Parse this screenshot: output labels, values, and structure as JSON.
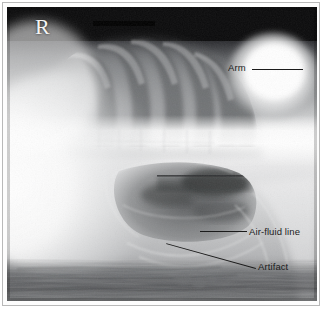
{
  "figure": {
    "type": "radiograph",
    "modality": "X-ray",
    "view": "lateral decubitus chest and abdomen",
    "laterality_marker": "R",
    "frame_color": "#b9b9b9",
    "mat_color": "#fdfdfd",
    "annotation_color": "#1b1b1b"
  },
  "annotations": [
    {
      "id": "arm",
      "label": "Arm",
      "label_x": 228,
      "label_y": 62,
      "leader": {
        "x1": 252,
        "y1": 69,
        "x2": 303,
        "y2": 69,
        "style": "horizontal"
      },
      "points_to": "bright rounded opacity at upper right of the film"
    },
    {
      "id": "air-fluid-line",
      "label": "Air-fluid line",
      "label_x": 249,
      "label_y": 226,
      "leader": {
        "x1": 200,
        "y1": 231,
        "x2": 247,
        "y2": 231,
        "style": "horizontal"
      },
      "points_to": "horizontal gas-fluid interface within the bowel loops"
    },
    {
      "id": "artifact",
      "label": "Artifact",
      "label_x": 258,
      "label_y": 261,
      "leader": {
        "x1": 256,
        "y1": 268,
        "x2": 166,
        "y2": 293,
        "style": "diagonal"
      },
      "points_to": "streaky overlying density at the lower edge of the film"
    }
  ],
  "anatomy_regions": [
    {
      "name": "ribs",
      "description": "obliquely oriented rib shadows with dark intercostal spaces over the thorax"
    },
    {
      "name": "lung-field",
      "description": "aerated lung producing darker bands between ribs"
    },
    {
      "name": "spine",
      "description": "faint vertebral bodies within the bright horizontal band across mid-film"
    },
    {
      "name": "soft-tissue-mass",
      "description": "broad bright soft-tissue opacity filling the left half of the film"
    },
    {
      "name": "bowel-gas",
      "description": "dark gas-filled bowel loops in the lower mid abdomen"
    },
    {
      "name": "table-edge",
      "description": "mottled dark streaky band along the bottom of the film"
    },
    {
      "name": "arm-opacity",
      "description": "bright rounded density of the superimposed arm at upper right"
    }
  ]
}
